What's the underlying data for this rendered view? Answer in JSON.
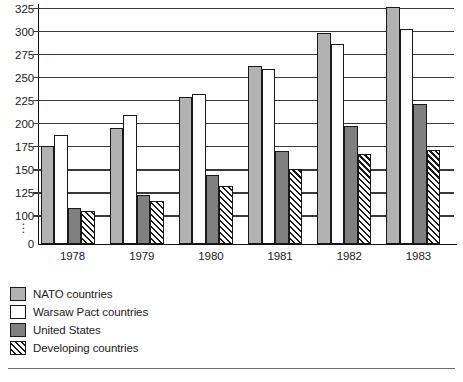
{
  "chart_data": {
    "type": "bar",
    "title": "",
    "subtitle": "",
    "xlabel": "",
    "ylabel": "",
    "categories": [
      "1978",
      "1979",
      "1980",
      "1981",
      "1982",
      "1983"
    ],
    "series": [
      {
        "name": "NATO countries",
        "key": "nato",
        "fill": "#b2b2b2",
        "pattern": "solid-light-gray",
        "values": [
          176,
          196,
          229,
          263,
          299,
          327
        ]
      },
      {
        "name": "Warsaw Pact countries",
        "key": "warsaw",
        "fill": "#ffffff",
        "pattern": "solid-white",
        "values": [
          188,
          210,
          232,
          259,
          287,
          303
        ]
      },
      {
        "name": "United States",
        "key": "us",
        "fill": "#808080",
        "pattern": "solid-dark-gray",
        "values": [
          109,
          123,
          144,
          171,
          198,
          222
        ]
      },
      {
        "name": "Developing countries",
        "key": "developing",
        "fill": "#ffffff",
        "pattern": "diagonal-hatch",
        "values": [
          105,
          116,
          133,
          151,
          167,
          172
        ]
      }
    ],
    "ylim": [
      100,
      330
    ],
    "y_axis_base_label": "0",
    "y_axis_broken": true,
    "y_axis_break_glyph": "⋮",
    "yticks": [
      325,
      300,
      275,
      250,
      225,
      200,
      175,
      150,
      125,
      100
    ],
    "ytick_labels": [
      "325",
      "300",
      "275",
      "250",
      "225",
      "200",
      "175",
      "150",
      "125",
      "100",
      "0"
    ],
    "grid": true,
    "grid_axis": "y",
    "legend_position": "below-left",
    "legend": [
      "NATO countries",
      "Warsaw Pact countries",
      "United States",
      "Developing countries"
    ]
  },
  "footer": {
    "source_note": ""
  },
  "colors": {
    "nato": "#b2b2b2",
    "warsaw": "#ffffff",
    "united_states": "#808080",
    "developing_hatch": "#1a1a1a",
    "axis": "#111111",
    "gridline": "#3a3a3a",
    "text": "#1c1c1c"
  }
}
